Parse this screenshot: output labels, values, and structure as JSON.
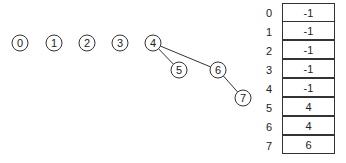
{
  "graph": {
    "nodes": [
      {
        "id": "0",
        "x": 20,
        "y": 43
      },
      {
        "id": "1",
        "x": 54,
        "y": 43
      },
      {
        "id": "2",
        "x": 87,
        "y": 43
      },
      {
        "id": "3",
        "x": 120,
        "y": 43
      },
      {
        "id": "4",
        "x": 153,
        "y": 43
      },
      {
        "id": "5",
        "x": 179,
        "y": 70
      },
      {
        "id": "6",
        "x": 218,
        "y": 70
      },
      {
        "id": "7",
        "x": 243,
        "y": 98
      }
    ],
    "edges": [
      {
        "from": "4",
        "to": "5"
      },
      {
        "from": "4",
        "to": "6"
      },
      {
        "from": "6",
        "to": "7"
      }
    ]
  },
  "parent_array": {
    "indices": [
      "0",
      "1",
      "2",
      "3",
      "4",
      "5",
      "6",
      "7"
    ],
    "values": [
      "-1",
      "-1",
      "-1",
      "-1",
      "-1",
      "4",
      "4",
      "6"
    ]
  },
  "colors": {
    "stroke": "#333333",
    "text": "#222222",
    "background": "#ffffff"
  }
}
